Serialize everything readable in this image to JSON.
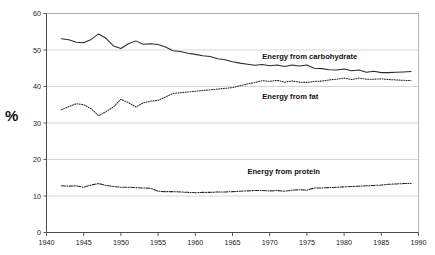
{
  "chart_data": {
    "type": "line",
    "title": "",
    "xlabel": "",
    "ylabel": "%",
    "xlim": [
      1940,
      1990
    ],
    "ylim": [
      0,
      60
    ],
    "grid": true,
    "legend_position": "inline-annotations",
    "x_ticks": [
      1940,
      1945,
      1950,
      1955,
      1960,
      1965,
      1970,
      1975,
      1980,
      1985,
      1990
    ],
    "y_ticks": [
      0,
      10,
      20,
      30,
      40,
      50,
      60
    ],
    "x": [
      1942,
      1943,
      1944,
      1945,
      1946,
      1947,
      1948,
      1949,
      1950,
      1951,
      1952,
      1953,
      1954,
      1955,
      1956,
      1957,
      1958,
      1959,
      1960,
      1961,
      1962,
      1963,
      1964,
      1965,
      1966,
      1967,
      1968,
      1969,
      1970,
      1971,
      1972,
      1973,
      1974,
      1975,
      1976,
      1977,
      1978,
      1979,
      1980,
      1981,
      1982,
      1983,
      1984,
      1985,
      1986,
      1987,
      1988,
      1989
    ],
    "series": [
      {
        "name": "Energy from carbohydrate",
        "style": "solid",
        "label_x": 1969,
        "label_y": 47.6,
        "values": [
          53.1,
          52.8,
          52.1,
          52.0,
          52.9,
          54.4,
          53.2,
          51.1,
          50.4,
          51.7,
          52.5,
          51.6,
          51.7,
          51.5,
          50.8,
          49.8,
          49.6,
          49.1,
          48.8,
          48.4,
          48.2,
          47.6,
          47.3,
          46.8,
          46.4,
          46.1,
          45.8,
          46.0,
          45.7,
          45.9,
          45.5,
          45.9,
          45.6,
          45.9,
          45.0,
          44.9,
          44.6,
          44.5,
          44.8,
          44.3,
          44.5,
          43.9,
          44.2,
          43.8,
          43.8,
          43.9,
          44.0,
          44.1
        ]
      },
      {
        "name": "Energy from fat",
        "style": "dotted",
        "label_x": 1969,
        "label_y": 36.5,
        "values": [
          33.6,
          34.5,
          35.3,
          35.0,
          33.9,
          32.0,
          33.1,
          34.4,
          36.5,
          35.6,
          34.4,
          35.5,
          36.0,
          36.2,
          37.1,
          38.1,
          38.3,
          38.5,
          38.7,
          38.9,
          39.1,
          39.3,
          39.5,
          39.7,
          40.2,
          40.7,
          41.1,
          41.6,
          41.4,
          41.7,
          41.2,
          41.5,
          41.2,
          41.1,
          41.4,
          41.5,
          41.8,
          42.0,
          42.3,
          41.9,
          42.3,
          42.0,
          42.0,
          42.1,
          41.9,
          41.8,
          41.7,
          41.6
        ]
      },
      {
        "name": "Energy from protein",
        "style": "dash-dot",
        "label_x": 1967,
        "label_y": 16.1,
        "values": [
          12.8,
          12.7,
          12.8,
          12.4,
          13.0,
          13.4,
          12.9,
          12.6,
          12.4,
          12.4,
          12.3,
          12.2,
          12.1,
          11.3,
          11.2,
          11.2,
          11.1,
          11.0,
          10.9,
          11.0,
          11.0,
          11.1,
          11.1,
          11.2,
          11.3,
          11.4,
          11.5,
          11.5,
          11.4,
          11.5,
          11.3,
          11.6,
          11.7,
          11.6,
          12.2,
          12.2,
          12.3,
          12.4,
          12.5,
          12.6,
          12.7,
          12.8,
          12.9,
          13.0,
          13.2,
          13.3,
          13.4,
          13.4
        ]
      }
    ]
  },
  "axis": {
    "y_title": "%"
  }
}
